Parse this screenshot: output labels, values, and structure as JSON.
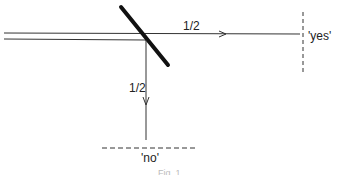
{
  "diagram": {
    "type": "beam-splitter",
    "colors": {
      "line": "#333333",
      "mirror": "#111111",
      "caption": "#bbbbbb"
    },
    "labels": {
      "transmitted_prob": "1/2",
      "reflected_prob": "1/2",
      "yes_detector": "'yes'",
      "no_detector": "'no'",
      "caption": "Fig. 1"
    }
  }
}
